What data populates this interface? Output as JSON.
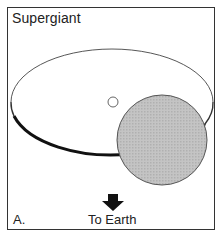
{
  "diagram": {
    "title": "Supergiant",
    "panel_label": "A.",
    "direction_label": "To Earth",
    "elements": {
      "orbit": {
        "shape": "ellipse",
        "cx": 112,
        "cy": 102,
        "rx": 101,
        "ry": 53,
        "stroke": "#222222"
      },
      "companion_star": {
        "shape": "circle",
        "cx": 113,
        "cy": 102,
        "r": 5,
        "fill": "#ffffff",
        "stroke": "#555555"
      },
      "supergiant_star": {
        "shape": "circle",
        "cx": 162,
        "cy": 140,
        "r": 45,
        "fill": "#bdbdbd",
        "stroke": "#555555"
      },
      "earth_arrow": {
        "shape": "arrow",
        "direction": "down",
        "fill": "#111111"
      }
    },
    "colors": {
      "frame": "#333333",
      "text": "#222222",
      "supergiant_fill": "#bdbdbd"
    }
  }
}
